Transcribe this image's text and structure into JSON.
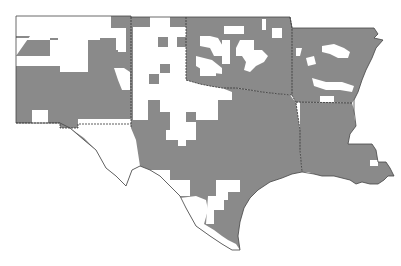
{
  "map": {
    "region": "South Central United States",
    "states": [
      {
        "id": "NM",
        "name": "New Mexico"
      },
      {
        "id": "TX",
        "name": "Texas"
      },
      {
        "id": "OK",
        "name": "Oklahoma"
      },
      {
        "id": "AR",
        "name": "Arkansas"
      },
      {
        "id": "LA",
        "name": "Louisiana"
      }
    ],
    "legend": {
      "shaded": "#8a8a8a",
      "unshaded": "#ffffff"
    },
    "colors": {
      "shade": "#8a8a8a",
      "background": "#ffffff",
      "border": "#333333"
    }
  }
}
